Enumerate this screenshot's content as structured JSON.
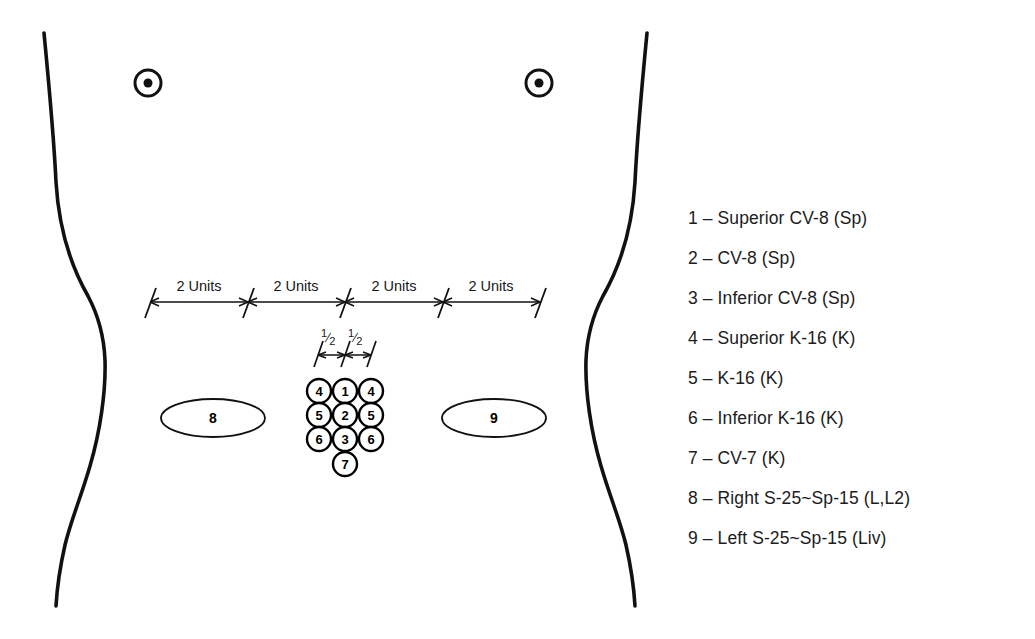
{
  "figure": {
    "background_color": "#ffffff",
    "line_color": "#111111"
  },
  "body_outline": {
    "left_contour_name": "left-torso-contour",
    "right_contour_name": "right-torso-contour"
  },
  "nipple_markers": [
    {
      "name": "left-nipple-marker",
      "cx": 148,
      "cy": 83,
      "r_outer": 13,
      "r_inner": 4.5
    },
    {
      "name": "right-nipple-marker",
      "cx": 539,
      "cy": 83,
      "r_outer": 13,
      "r_inner": 4.5
    }
  ],
  "main_ruler": {
    "y": 302,
    "x_start": 150,
    "x_end": 540,
    "tick_positions": [
      150,
      248,
      345,
      443,
      540
    ],
    "segment_labels": [
      "2 Units",
      "2 Units",
      "2 Units",
      "2 Units"
    ]
  },
  "half_ruler": {
    "y": 355,
    "x_start": 318,
    "x_end": 371,
    "tick_positions": [
      318,
      345,
      371
    ],
    "segment_labels": [
      "1/2",
      "1/2"
    ],
    "fraction_numerator": "1",
    "fraction_denominator": "2"
  },
  "point_cluster": {
    "circle_radius": 12,
    "rows": [
      {
        "y": 391,
        "points": [
          {
            "label": "4",
            "cx": 319
          },
          {
            "label": "1",
            "cx": 345
          },
          {
            "label": "4",
            "cx": 371
          }
        ]
      },
      {
        "y": 415,
        "points": [
          {
            "label": "5",
            "cx": 319
          },
          {
            "label": "2",
            "cx": 345
          },
          {
            "label": "5",
            "cx": 371
          }
        ]
      },
      {
        "y": 439,
        "points": [
          {
            "label": "6",
            "cx": 319
          },
          {
            "label": "3",
            "cx": 345
          },
          {
            "label": "6",
            "cx": 371
          }
        ]
      },
      {
        "y": 464,
        "points": [
          {
            "label": "7",
            "cx": 345
          }
        ]
      }
    ]
  },
  "ellipse_markers": [
    {
      "name": "ellipse-marker-8",
      "label": "8",
      "cx": 213,
      "cy": 418,
      "rx": 52,
      "ry": 19
    },
    {
      "name": "ellipse-marker-9",
      "label": "9",
      "cx": 494,
      "cy": 418,
      "rx": 52,
      "ry": 19
    }
  ],
  "legend": {
    "items": [
      {
        "number": "1",
        "text": "1 – Superior CV-8 (Sp)"
      },
      {
        "number": "2",
        "text": "2 – CV-8 (Sp)"
      },
      {
        "number": "3",
        "text": "3 – Inferior CV-8 (Sp)"
      },
      {
        "number": "4",
        "text": "4 – Superior K-16 (K)"
      },
      {
        "number": "5",
        "text": "5 – K-16 (K)"
      },
      {
        "number": "6",
        "text": "6 – Inferior K-16 (K)"
      },
      {
        "number": "7",
        "text": "7 – CV-7 (K)"
      },
      {
        "number": "8",
        "text": "8 – Right S-25~Sp-15 (L,L2)"
      },
      {
        "number": "9",
        "text": "9 – Left S-25~Sp-15 (Liv)"
      }
    ]
  }
}
